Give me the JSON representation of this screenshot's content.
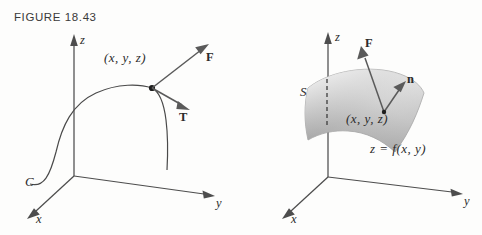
{
  "page": {
    "background": "#fdfdfc",
    "width": 482,
    "height": 235
  },
  "figures": [
    {
      "id": "figure-18-43",
      "caption": "FIGURE 18.43",
      "subject": "space curve C with force vector F and unit tangent vector T at a point",
      "axes": {
        "z_label": "z",
        "y_label": "y",
        "x_label": "x",
        "origin": [
          74,
          176
        ],
        "z_tip": [
          74,
          38
        ],
        "y_tip": [
          214,
          197
        ],
        "x_tip": [
          28,
          218
        ],
        "color": "#4d4d4d"
      },
      "curve": {
        "label": "C",
        "color": "#4a4a4a",
        "label_pos": [
          32,
          183
        ]
      },
      "point": {
        "label": "(x, y, z)",
        "label_pos": [
          108,
          58
        ],
        "dot_pos": [
          152,
          88
        ],
        "color": "#1d1d1d"
      },
      "vectors": [
        {
          "label": "F",
          "from": [
            152,
            88
          ],
          "to": [
            208,
            45
          ],
          "label_pos": [
            211,
            57
          ],
          "color": "#5a5a5a"
        },
        {
          "label": "T",
          "from": [
            152,
            88
          ],
          "to": [
            188,
            109
          ],
          "label_pos": [
            183,
            118
          ],
          "color": "#5a5a5a"
        }
      ]
    },
    {
      "id": "figure-18-44",
      "caption": "FIGURE 18.44",
      "subject": "surface S given by z = f(x, y) with force vector F and unit normal vector n at a point",
      "axes": {
        "z_label": "z",
        "y_label": "y",
        "x_label": "x",
        "origin": [
          328,
          177
        ],
        "z_tip": [
          328,
          35
        ],
        "y_tip": [
          462,
          195
        ],
        "x_tip": [
          283,
          218
        ],
        "color": "#4d4d4d"
      },
      "surface": {
        "label": "S",
        "label_pos": [
          301,
          86
        ],
        "equation": "z = f(x, y)",
        "equation_pos": [
          372,
          143
        ],
        "fill_light": "#f2f2f2",
        "fill_mid": "#b9b9b9",
        "fill_dark": "#8d8d8d"
      },
      "dashed_edge": {
        "name": "surface-trace-dashed",
        "from": [
          327,
          79
        ],
        "to": [
          327,
          126
        ]
      },
      "point": {
        "label": "(x, y, z)",
        "label_pos": [
          350,
          112
        ],
        "dot_pos": [
          384,
          112
        ]
      },
      "vectors": [
        {
          "label": "F",
          "from": [
            384,
            112
          ],
          "to": [
            361,
            48
          ],
          "label_pos": [
            366,
            44
          ],
          "color": "#5a5a5a"
        },
        {
          "label": "n",
          "from": [
            384,
            112
          ],
          "to": [
            404,
            84
          ],
          "label_pos": [
            404,
            79
          ],
          "color": "#5a5a5a"
        }
      ]
    }
  ]
}
